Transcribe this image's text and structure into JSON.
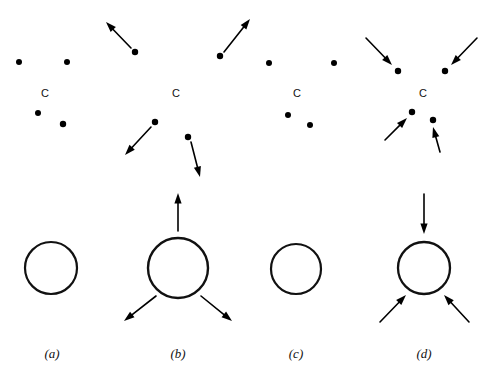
{
  "figure": {
    "width": 491,
    "height": 381,
    "background_color": "#ffffff",
    "ink_color": "#000000",
    "panels": [
      {
        "id": "a",
        "caption": "(a)",
        "caption_x": 52,
        "caption_y": 358,
        "cluster_label": "C",
        "cluster_label_x": 45,
        "cluster_label_y": 97,
        "motion": "none",
        "dots": [
          {
            "x": 19,
            "y": 62,
            "r": 3.0
          },
          {
            "x": 67,
            "y": 62,
            "r": 3.0
          },
          {
            "x": 38,
            "y": 113,
            "r": 3.0
          },
          {
            "x": 63,
            "y": 124,
            "r": 3.2
          }
        ],
        "arrows": [],
        "circle": {
          "cx": 51,
          "cy": 268,
          "r": 26,
          "stroke_width": 2.2
        },
        "circle_arrows": []
      },
      {
        "id": "b",
        "caption": "(b)",
        "caption_x": 178,
        "caption_y": 358,
        "cluster_label": "C",
        "cluster_label_x": 176,
        "cluster_label_y": 97,
        "motion": "expanding",
        "dots": [
          {
            "x": 135,
            "y": 52,
            "r": 3.2
          },
          {
            "x": 220,
            "y": 56,
            "r": 3.2
          },
          {
            "x": 155,
            "y": 122,
            "r": 3.2
          },
          {
            "x": 188,
            "y": 137,
            "r": 3.2
          }
        ],
        "arrows": [
          {
            "x1": 131,
            "y1": 48,
            "x2": 106,
            "y2": 22
          },
          {
            "x1": 224,
            "y1": 52,
            "x2": 250,
            "y2": 19
          },
          {
            "x1": 151,
            "y1": 127,
            "x2": 125,
            "y2": 155
          },
          {
            "x1": 191,
            "y1": 142,
            "x2": 200,
            "y2": 177
          }
        ],
        "circle": {
          "cx": 178,
          "cy": 268,
          "r": 30,
          "stroke_width": 2.4
        },
        "circle_arrows": [
          {
            "x1": 178,
            "y1": 231,
            "x2": 178,
            "y2": 193
          },
          {
            "x1": 156,
            "y1": 296,
            "x2": 124,
            "y2": 321
          },
          {
            "x1": 201,
            "y1": 296,
            "x2": 232,
            "y2": 321
          }
        ]
      },
      {
        "id": "c",
        "caption": "(c)",
        "caption_x": 296,
        "caption_y": 358,
        "cluster_label": "C",
        "cluster_label_x": 297,
        "cluster_label_y": 97,
        "motion": "none",
        "dots": [
          {
            "x": 269,
            "y": 63,
            "r": 3.0
          },
          {
            "x": 334,
            "y": 63,
            "r": 3.0
          },
          {
            "x": 288,
            "y": 115,
            "r": 3.0
          },
          {
            "x": 310,
            "y": 125,
            "r": 3.0
          }
        ],
        "arrows": [],
        "circle": {
          "cx": 296,
          "cy": 269,
          "r": 25,
          "stroke_width": 2.2
        },
        "circle_arrows": []
      },
      {
        "id": "d",
        "caption": "(d)",
        "caption_x": 424,
        "caption_y": 358,
        "cluster_label": "C",
        "cluster_label_x": 423,
        "cluster_label_y": 97,
        "motion": "contracting",
        "dots": [
          {
            "x": 398,
            "y": 71,
            "r": 3.2
          },
          {
            "x": 445,
            "y": 71,
            "r": 3.2
          },
          {
            "x": 412,
            "y": 112,
            "r": 3.2
          },
          {
            "x": 433,
            "y": 120,
            "r": 3.2
          }
        ],
        "arrows": [
          {
            "x1": 366,
            "y1": 38,
            "x2": 392,
            "y2": 65
          },
          {
            "x1": 477,
            "y1": 38,
            "x2": 451,
            "y2": 65
          },
          {
            "x1": 385,
            "y1": 140,
            "x2": 407,
            "y2": 118
          },
          {
            "x1": 440,
            "y1": 152,
            "x2": 433,
            "y2": 127
          }
        ],
        "circle": {
          "cx": 424,
          "cy": 268,
          "r": 26,
          "stroke_width": 2.3
        },
        "circle_arrows": [
          {
            "x1": 424,
            "y1": 194,
            "x2": 424,
            "y2": 234
          },
          {
            "x1": 380,
            "y1": 322,
            "x2": 406,
            "y2": 295
          },
          {
            "x1": 469,
            "y1": 322,
            "x2": 444,
            "y2": 295
          }
        ]
      }
    ]
  }
}
